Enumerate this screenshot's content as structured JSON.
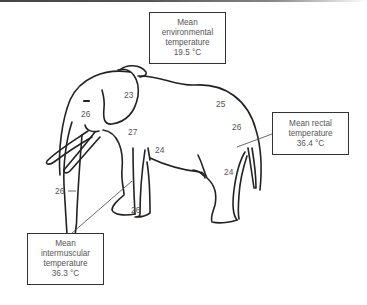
{
  "figure": {
    "boxes": {
      "environmental": {
        "lines": [
          "Mean",
          "environmental",
          "temperature",
          "19.5 °C"
        ]
      },
      "rectal": {
        "lines": [
          "Mean rectal",
          "temperature",
          "36.4 °C"
        ]
      },
      "intermuscular": {
        "lines": [
          "Mean",
          "intermuscular",
          "temperature",
          "36.3 °C"
        ]
      }
    },
    "surface_temperatures": [
      {
        "location": "ear",
        "value": "23"
      },
      {
        "location": "head",
        "value": "26"
      },
      {
        "location": "back",
        "value": "25"
      },
      {
        "location": "rump",
        "value": "26"
      },
      {
        "location": "shoulder",
        "value": "27"
      },
      {
        "location": "belly-front-leg",
        "value": "24"
      },
      {
        "location": "hind-leg",
        "value": "24"
      },
      {
        "location": "trunk",
        "value": "26"
      },
      {
        "location": "front-foot",
        "value": "26"
      }
    ]
  }
}
